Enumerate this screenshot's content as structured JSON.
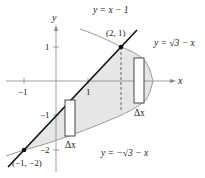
{
  "figure": {
    "axes": {
      "x_label": "x",
      "y_label": "y",
      "x_ticks": [
        {
          "value": -1,
          "label": "−1"
        },
        {
          "value": 1,
          "label": "1"
        }
      ],
      "y_ticks": [
        {
          "value": 1,
          "label": "1"
        },
        {
          "value": -1,
          "label": "−1"
        },
        {
          "value": -2,
          "label": "−2"
        }
      ]
    },
    "curves": {
      "line_label": "y = x − 1",
      "upper_label": "y = √3 − x",
      "lower_label": "y = −√3 − x"
    },
    "points": [
      {
        "label": "(2, 1)",
        "x": 2,
        "y": 1
      },
      {
        "label": "(−1, −2)",
        "x": -1,
        "y": -2
      }
    ],
    "rectangles": [
      {
        "label": "Δx",
        "position": "left"
      },
      {
        "label": "Δx",
        "position": "right"
      }
    ],
    "colors": {
      "shade": "#e6e6e6",
      "line": "#111111",
      "curve": "#9a9a9a",
      "axis": "#888888"
    }
  }
}
